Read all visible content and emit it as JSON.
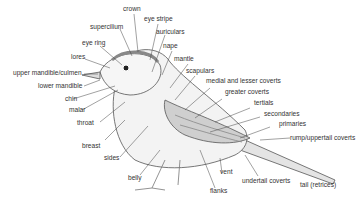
{
  "diagram": {
    "labels": {
      "crown": "crown",
      "eye_stripe": "eye stripe",
      "supercilium": "supercilium",
      "auriculars": "auriculars",
      "eye_ring": "eye ring",
      "nape": "nape",
      "lores": "lores",
      "mantle": "mantle",
      "upper_mandible": "upper mandible/culmen",
      "scapulars": "scapulars",
      "lower_mandible": "lower mandible",
      "medial_lesser_coverts": "medial and lesser coverts",
      "chin": "chin",
      "greater_coverts": "greater coverts",
      "malar": "malar",
      "tertials": "tertials",
      "throat": "throat",
      "secondaries": "secondaries",
      "primaries": "primaries",
      "rump": "rump/uppertail coverts",
      "breast": "breast",
      "sides": "sides",
      "belly": "belly",
      "vent": "vent",
      "undertail_coverts": "undertail coverts",
      "flanks": "flanks",
      "tail": "tail (retrices)"
    }
  }
}
